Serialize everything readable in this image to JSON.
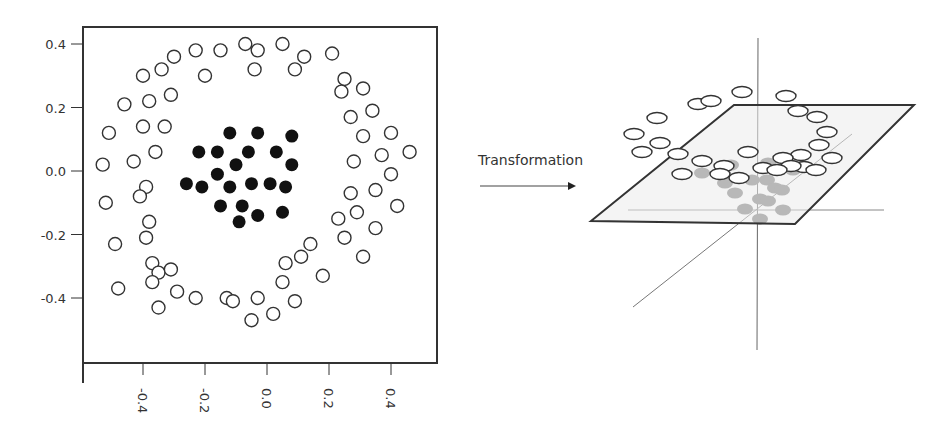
{
  "chart_data": [
    {
      "type": "scatter",
      "title": "",
      "xlabel": "",
      "ylabel": "",
      "xlim": [
        -0.6,
        0.55
      ],
      "ylim": [
        -0.6,
        0.46
      ],
      "x_ticks": [
        -0.4,
        -0.2,
        0.0,
        0.2,
        0.4
      ],
      "x_tick_labels": [
        "-0.4",
        "-0.2",
        "0.0",
        "0.2",
        "0.4"
      ],
      "x_tick_label_rotation": "vertical",
      "y_ticks": [
        0.4,
        0.2,
        0.0,
        -0.2,
        -0.4
      ],
      "y_tick_labels": [
        "0.4",
        "0.2",
        "0.0",
        "-0.2",
        "-0.4"
      ],
      "grid": false,
      "legend": "none",
      "series": [
        {
          "name": "outer ring",
          "marker": "open-circle",
          "color": "#333333",
          "points": [
            [
              -0.4,
              0.3
            ],
            [
              -0.34,
              0.32
            ],
            [
              -0.3,
              0.36
            ],
            [
              -0.23,
              0.38
            ],
            [
              -0.15,
              0.38
            ],
            [
              -0.07,
              0.4
            ],
            [
              -0.03,
              0.38
            ],
            [
              0.05,
              0.4
            ],
            [
              0.12,
              0.36
            ],
            [
              0.21,
              0.37
            ],
            [
              -0.2,
              0.3
            ],
            [
              -0.04,
              0.32
            ],
            [
              0.09,
              0.32
            ],
            [
              0.25,
              0.29
            ],
            [
              0.31,
              0.26
            ],
            [
              0.24,
              0.25
            ],
            [
              -0.46,
              0.21
            ],
            [
              -0.38,
              0.22
            ],
            [
              -0.31,
              0.24
            ],
            [
              0.27,
              0.17
            ],
            [
              0.34,
              0.19
            ],
            [
              -0.51,
              0.12
            ],
            [
              -0.4,
              0.14
            ],
            [
              -0.33,
              0.14
            ],
            [
              0.31,
              0.11
            ],
            [
              0.4,
              0.12
            ],
            [
              -0.36,
              0.06
            ],
            [
              -0.43,
              0.03
            ],
            [
              0.28,
              0.03
            ],
            [
              0.37,
              0.05
            ],
            [
              0.46,
              0.06
            ],
            [
              -0.53,
              0.02
            ],
            [
              0.4,
              -0.01
            ],
            [
              -0.39,
              -0.05
            ],
            [
              -0.41,
              -0.08
            ],
            [
              0.27,
              -0.07
            ],
            [
              0.35,
              -0.06
            ],
            [
              -0.52,
              -0.1
            ],
            [
              0.42,
              -0.11
            ],
            [
              -0.38,
              -0.16
            ],
            [
              -0.39,
              -0.21
            ],
            [
              0.23,
              -0.15
            ],
            [
              0.29,
              -0.13
            ],
            [
              0.35,
              -0.18
            ],
            [
              -0.49,
              -0.23
            ],
            [
              0.14,
              -0.23
            ],
            [
              0.25,
              -0.21
            ],
            [
              0.31,
              -0.27
            ],
            [
              -0.37,
              -0.29
            ],
            [
              -0.35,
              -0.32
            ],
            [
              -0.31,
              -0.31
            ],
            [
              0.06,
              -0.29
            ],
            [
              0.11,
              -0.27
            ],
            [
              -0.48,
              -0.37
            ],
            [
              -0.37,
              -0.35
            ],
            [
              -0.29,
              -0.38
            ],
            [
              -0.23,
              -0.4
            ],
            [
              -0.13,
              -0.4
            ],
            [
              -0.11,
              -0.41
            ],
            [
              -0.03,
              -0.4
            ],
            [
              0.05,
              -0.35
            ],
            [
              0.09,
              -0.41
            ],
            [
              0.18,
              -0.33
            ],
            [
              -0.35,
              -0.43
            ],
            [
              -0.05,
              -0.47
            ],
            [
              0.02,
              -0.45
            ]
          ]
        },
        {
          "name": "inner cluster",
          "marker": "filled-circle",
          "color": "#111111",
          "points": [
            [
              -0.12,
              0.12
            ],
            [
              -0.03,
              0.12
            ],
            [
              0.08,
              0.11
            ],
            [
              -0.22,
              0.06
            ],
            [
              -0.16,
              0.06
            ],
            [
              -0.06,
              0.06
            ],
            [
              0.03,
              0.06
            ],
            [
              -0.1,
              0.02
            ],
            [
              0.08,
              0.02
            ],
            [
              -0.16,
              -0.01
            ],
            [
              -0.26,
              -0.04
            ],
            [
              -0.21,
              -0.05
            ],
            [
              -0.12,
              -0.05
            ],
            [
              -0.05,
              -0.04
            ],
            [
              0.01,
              -0.04
            ],
            [
              0.06,
              -0.05
            ],
            [
              -0.15,
              -0.11
            ],
            [
              -0.08,
              -0.11
            ],
            [
              -0.03,
              -0.14
            ],
            [
              0.05,
              -0.13
            ],
            [
              -0.09,
              -0.16
            ]
          ]
        }
      ]
    },
    {
      "type": "scatter",
      "title": "",
      "projection": "3d",
      "description": "Same points lifted into 3D; filled cluster sits below a separating plane, open ring above it",
      "grid": false,
      "legend": "none",
      "series": [
        {
          "name": "outer ring (above plane)",
          "marker": "open-ellipse",
          "count": 27
        },
        {
          "name": "inner cluster (below plane)",
          "marker": "filled-ellipse",
          "color": "#777777",
          "count": 16
        }
      ]
    }
  ],
  "annotation": {
    "arrow_label": "Transformation",
    "arrow_icon": "right-arrow-icon"
  },
  "colors": {
    "axis": "#333333",
    "open_marker_stroke": "#333333",
    "filled_marker_left": "#111111",
    "filled_marker_right": "#7a7a7a",
    "plane_edge": "#333333",
    "guide_axes": "#777777"
  }
}
